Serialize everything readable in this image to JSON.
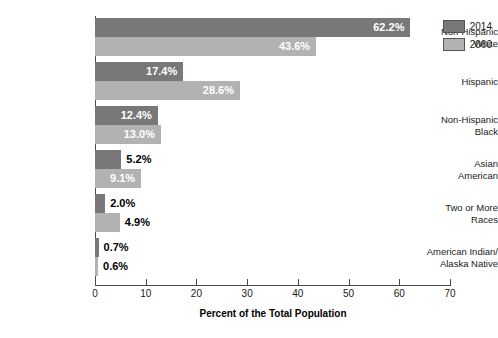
{
  "chart_data": {
    "type": "bar",
    "orientation": "horizontal",
    "title": "",
    "xlabel": "Percent of the Total Population",
    "ylabel": "",
    "xlim": [
      0,
      70
    ],
    "xticks": [
      0,
      10,
      20,
      30,
      40,
      50,
      60,
      70
    ],
    "grid": false,
    "legend_position": "top-right",
    "categories": [
      "Non-Hispanic White",
      "Hispanic",
      "Non-Hispanic Black",
      "Asian American",
      "Two or More Races",
      "American Indian/ Alaska Native"
    ],
    "category_lines": [
      [
        "Non-Hispanic",
        "White"
      ],
      [
        "Hispanic",
        ""
      ],
      [
        "Non-Hispanic",
        "Black"
      ],
      [
        "Asian",
        "American"
      ],
      [
        "Two or More",
        "Races"
      ],
      [
        "American Indian/",
        "Alaska Native"
      ]
    ],
    "series": [
      {
        "name": "2014",
        "color": "#787878",
        "values": [
          62.2,
          17.4,
          12.4,
          5.2,
          2.0,
          0.7
        ],
        "labels": [
          "62.2%",
          "17.4%",
          "12.4%",
          "5.2%",
          "2.0%",
          "0.7%"
        ]
      },
      {
        "name": "2060",
        "color": "#b2b2b2",
        "values": [
          43.6,
          28.6,
          13.0,
          9.1,
          4.9,
          0.6
        ],
        "labels": [
          "43.6%",
          "28.6%",
          "13.0%",
          "9.1%",
          "4.9%",
          "0.6%"
        ]
      }
    ]
  },
  "legend": {
    "items": [
      {
        "label": "2014",
        "color": "#787878"
      },
      {
        "label": "2060",
        "color": "#b2b2b2"
      }
    ]
  },
  "axis": {
    "x_title": "Percent of the Total Population",
    "tick_labels": [
      "0",
      "10",
      "20",
      "30",
      "40",
      "50",
      "60",
      "70"
    ]
  }
}
